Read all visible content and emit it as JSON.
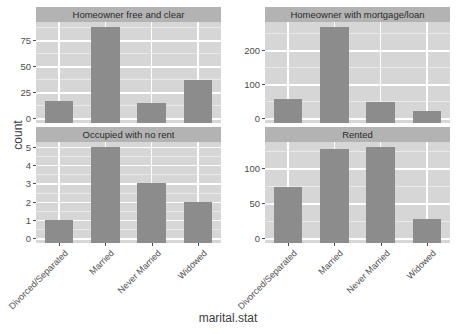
{
  "chart_data": {
    "type": "bar",
    "title": "",
    "xlabel": "marital.stat",
    "ylabel": "count",
    "grid": true,
    "legend": "none",
    "facet_layout": "2x2 grid, free y scales",
    "categories": [
      "Divorced/Separated",
      "Married",
      "Never Married",
      "Widowed"
    ],
    "facets": [
      {
        "name": "Homeowner free and clear",
        "values": [
          17,
          88,
          15,
          37
        ],
        "ylim": [
          0,
          88
        ],
        "yticks": [
          0,
          25,
          50,
          75
        ]
      },
      {
        "name": "Homeowner with mortgage/loan",
        "values": [
          57,
          270,
          49,
          22
        ],
        "ylim": [
          0,
          270
        ],
        "yticks": [
          0,
          100,
          200
        ]
      },
      {
        "name": "Occupied with no rent",
        "values": [
          1,
          5,
          3,
          2
        ],
        "ylim": [
          0,
          5
        ],
        "yticks": [
          0,
          1,
          2,
          3,
          4,
          5
        ]
      },
      {
        "name": "Rented",
        "values": [
          74,
          128,
          131,
          28
        ],
        "ylim": [
          0,
          131
        ],
        "yticks": [
          0,
          50,
          100
        ]
      }
    ],
    "colors": {
      "bar": "#8c8c8c",
      "panel_background": "#d6d6d6",
      "strip_background": "#b3b3b3",
      "gridline_major": "#ffffff",
      "gridline_minor": "#eaeaea",
      "text": "#4d4d4d",
      "plot_background": "#ffffff"
    }
  }
}
